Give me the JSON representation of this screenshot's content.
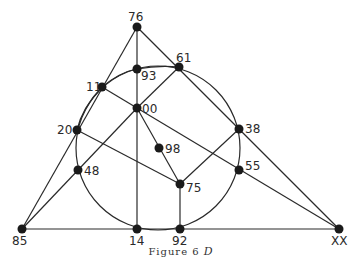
{
  "figure": {
    "caption_prefix": "Figure 6",
    "caption_letter": "D"
  },
  "points": {
    "p76": {
      "label": "76",
      "x": 137,
      "y": 27
    },
    "p93": {
      "label": "93",
      "x": 137,
      "y": 69
    },
    "p61": {
      "label": "61",
      "x": 179,
      "y": 67
    },
    "p11": {
      "label": "11",
      "x": 102,
      "y": 87
    },
    "p00": {
      "label": "00",
      "x": 137,
      "y": 108
    },
    "p20": {
      "label": "20",
      "x": 77,
      "y": 130
    },
    "p38": {
      "label": "38",
      "x": 239,
      "y": 129
    },
    "p98": {
      "label": "98",
      "x": 159,
      "y": 148
    },
    "p48": {
      "label": "48",
      "x": 78,
      "y": 170
    },
    "p55": {
      "label": "55",
      "x": 239,
      "y": 170
    },
    "p75": {
      "label": "75",
      "x": 180,
      "y": 184
    },
    "p85": {
      "label": "85",
      "x": 22,
      "y": 229
    },
    "p14": {
      "label": "14",
      "x": 137,
      "y": 229
    },
    "p92": {
      "label": "92",
      "x": 180,
      "y": 229
    },
    "pXX": {
      "label": "XX",
      "x": 339,
      "y": 229
    }
  },
  "circle": {
    "cx": 158,
    "cy": 148,
    "r": 82
  }
}
